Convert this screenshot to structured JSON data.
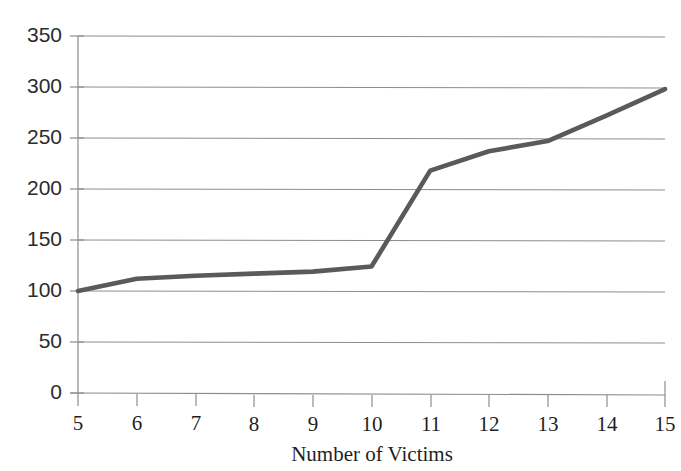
{
  "chart_data": {
    "type": "line",
    "title": "",
    "xlabel": "Number of Victims",
    "ylabel": "",
    "x": [
      5,
      6,
      7,
      8,
      9,
      10,
      11,
      12,
      13,
      14,
      15
    ],
    "values": [
      100,
      112,
      115,
      117,
      119,
      124,
      218,
      237,
      247,
      272,
      298
    ],
    "series": [
      {
        "name": "",
        "values": [
          100,
          112,
          115,
          117,
          119,
          124,
          218,
          237,
          247,
          272,
          298
        ]
      }
    ],
    "xtick_labels": [
      "5",
      "6",
      "7",
      "8",
      "9",
      "10",
      "11",
      "12",
      "13",
      "14",
      "15"
    ],
    "ytick_labels": [
      "0",
      "50",
      "100",
      "150",
      "200",
      "250",
      "300",
      "350"
    ],
    "ytick_values": [
      0,
      50,
      100,
      150,
      200,
      250,
      300,
      350
    ],
    "xlim": [
      5,
      15
    ],
    "ylim": [
      0,
      350
    ],
    "grid": "horizontal",
    "legend": "none",
    "line_color": "#5a5a5a",
    "grid_color": "#8d8d8d",
    "background_color": "#ffffff"
  }
}
